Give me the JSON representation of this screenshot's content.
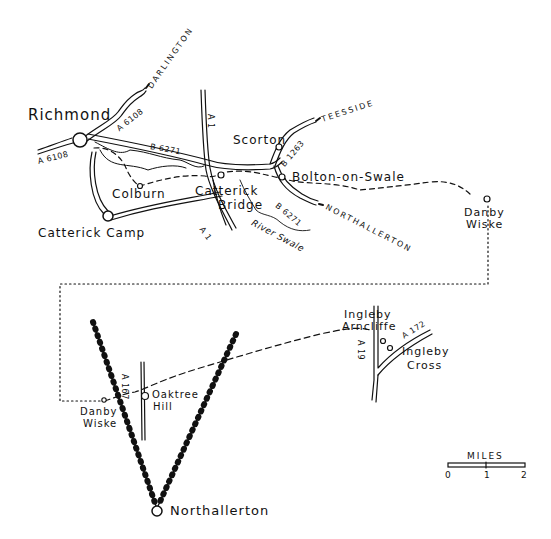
{
  "map": {
    "towns": {
      "richmond": "Richmond",
      "colburn": "Colburn",
      "catterick_camp": "Catterick Camp",
      "catterick_bridge_1": "Catterick",
      "catterick_bridge_2": "Bridge",
      "scorton": "Scorton",
      "bolton_on_swale": "Bolton-on-Swale",
      "danby_wiske_top_1": "Danby",
      "danby_wiske_top_2": "Wiske",
      "ingleby_arncliffe_1": "Ingleby",
      "ingleby_arncliffe_2": "Arncliffe",
      "ingleby_cross_1": "Ingleby",
      "ingleby_cross_2": "Cross",
      "oaktree_hill_1": "Oaktree",
      "oaktree_hill_2": "Hill",
      "danby_wiske_bottom_1": "Danby",
      "danby_wiske_bottom_2": "Wiske",
      "northallerton": "Northallerton"
    },
    "roads": {
      "a6108_north": "A 6108",
      "a6108_west": "A 6108",
      "b6271_top": "B 6271",
      "b6271_lower": "B 6271",
      "a1_top": "A 1",
      "a1_bottom": "A 1",
      "b1263": "B 1263",
      "a19": "A 19",
      "a172": "A 172",
      "a167": "A 167"
    },
    "destinations": {
      "darlington": "DARLINGTON",
      "teesside": "TEESSIDE",
      "northallerton_arrow": "NORTHALLERTON"
    },
    "rivers": {
      "swale": "River Swale"
    },
    "scale_bar": {
      "title": "MILES",
      "ticks": [
        "0",
        "1",
        "2"
      ]
    }
  }
}
